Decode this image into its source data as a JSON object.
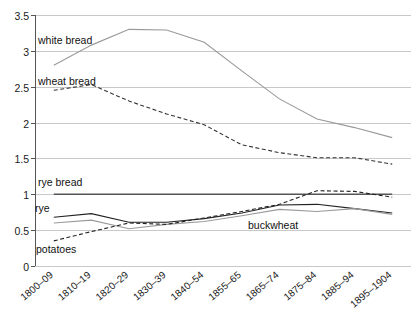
{
  "chart_data": {
    "type": "line",
    "title": "",
    "xlabel": "",
    "ylabel": "",
    "ylim": [
      0,
      3.5
    ],
    "yticks": [
      "0",
      "0.5",
      "1",
      "1.5",
      "2",
      "2.5",
      "3",
      "3.5"
    ],
    "ytick_values": [
      0,
      0.5,
      1,
      1.5,
      2,
      2.5,
      3,
      3.5
    ],
    "grid": true,
    "legend_position": "inline-annotations",
    "categories": [
      "1800–09",
      "1810–19",
      "1820–29",
      "1830–39",
      "1840–54",
      "1855–65",
      "1865–74",
      "1875–84",
      "1885–94",
      "1895–1904"
    ],
    "series": [
      {
        "name": "white bread",
        "style": "solid",
        "color": "#999999",
        "values": [
          2.8,
          3.08,
          3.3,
          3.29,
          3.12,
          2.72,
          2.33,
          2.05,
          1.93,
          1.79
        ]
      },
      {
        "name": "wheat bread",
        "style": "dashed",
        "color": "#333333",
        "values": [
          2.45,
          2.53,
          2.3,
          2.12,
          1.97,
          1.69,
          1.58,
          1.51,
          1.51,
          1.42
        ]
      },
      {
        "name": "rye bread",
        "style": "solid",
        "color": "#555555",
        "values": [
          1.0,
          1.0,
          1.0,
          1.0,
          1.0,
          1.0,
          1.0,
          1.0,
          1.0,
          1.0
        ]
      },
      {
        "name": "rye",
        "style": "solid",
        "color": "#222222",
        "values": [
          0.68,
          0.73,
          0.61,
          0.61,
          0.66,
          0.74,
          0.85,
          0.86,
          0.8,
          0.74
        ]
      },
      {
        "name": "buckwheat",
        "style": "solid",
        "color": "#9a9a9a",
        "values": [
          0.6,
          0.64,
          0.52,
          0.58,
          0.62,
          0.7,
          0.79,
          0.76,
          0.8,
          0.72
        ]
      },
      {
        "name": "potatoes",
        "style": "dashed",
        "color": "#222222",
        "values": [
          0.35,
          0.48,
          0.6,
          0.58,
          0.67,
          0.76,
          0.86,
          1.05,
          1.04,
          0.96
        ]
      }
    ],
    "annotations": [
      {
        "text": "white bread",
        "x": 38,
        "y": 44
      },
      {
        "text": "wheat bread",
        "x": 38,
        "y": 85
      },
      {
        "text": "rye bread",
        "x": 38,
        "y": 186
      },
      {
        "text": "rye",
        "x": 35,
        "y": 212
      },
      {
        "text": "buckwheat",
        "x": 248,
        "y": 229
      },
      {
        "text": "potatoes",
        "x": 36,
        "y": 253
      }
    ]
  }
}
